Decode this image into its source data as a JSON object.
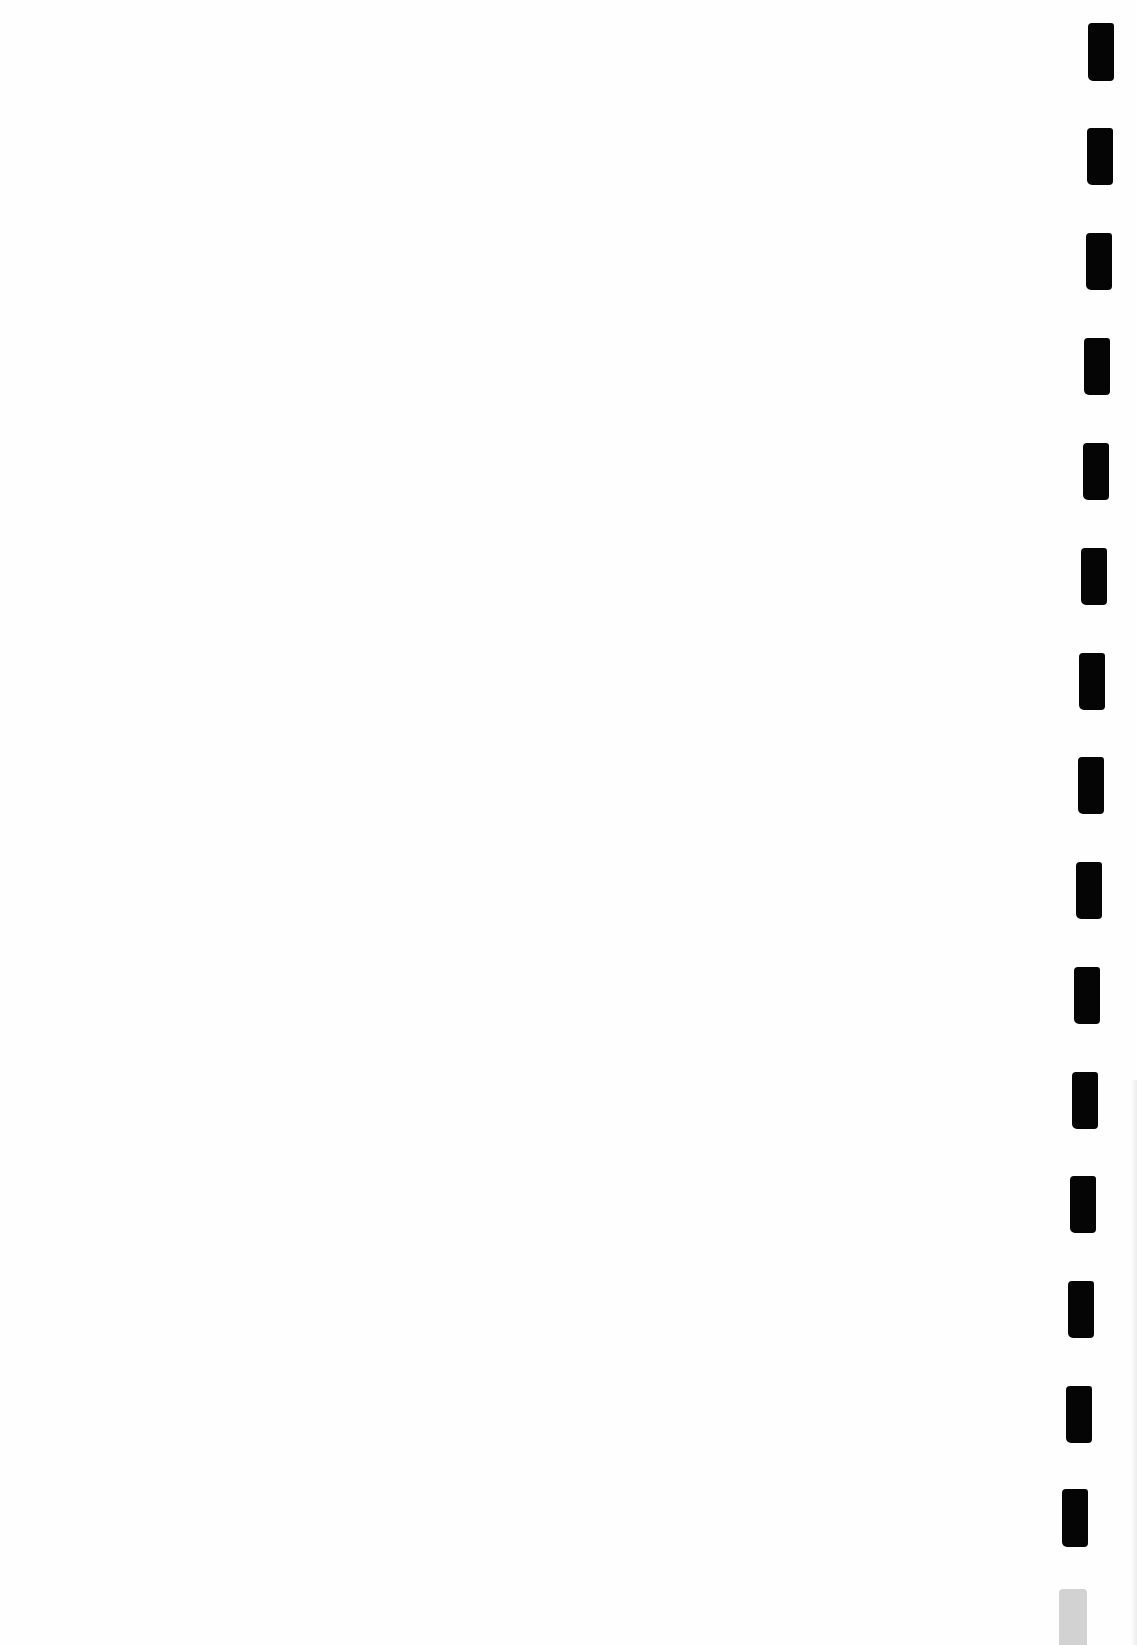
{
  "page": {
    "background": "#ffffff",
    "text_content": ""
  },
  "timing_marks": {
    "color": "#050505",
    "faded_color": "#d2d2d2",
    "marks": [
      {
        "x": 1088,
        "y": 23,
        "w": 26,
        "h": 58,
        "faded": false
      },
      {
        "x": 1087,
        "y": 128,
        "w": 26,
        "h": 57,
        "faded": false
      },
      {
        "x": 1086,
        "y": 233,
        "w": 26,
        "h": 57,
        "faded": false
      },
      {
        "x": 1084,
        "y": 338,
        "w": 26,
        "h": 57,
        "faded": false
      },
      {
        "x": 1083,
        "y": 443,
        "w": 26,
        "h": 57,
        "faded": false
      },
      {
        "x": 1081,
        "y": 548,
        "w": 26,
        "h": 57,
        "faded": false
      },
      {
        "x": 1079,
        "y": 653,
        "w": 26,
        "h": 57,
        "faded": false
      },
      {
        "x": 1078,
        "y": 757,
        "w": 26,
        "h": 57,
        "faded": false
      },
      {
        "x": 1076,
        "y": 862,
        "w": 26,
        "h": 57,
        "faded": false
      },
      {
        "x": 1074,
        "y": 967,
        "w": 26,
        "h": 57,
        "faded": false
      },
      {
        "x": 1072,
        "y": 1072,
        "w": 26,
        "h": 57,
        "faded": false
      },
      {
        "x": 1070,
        "y": 1176,
        "w": 26,
        "h": 57,
        "faded": false
      },
      {
        "x": 1068,
        "y": 1281,
        "w": 26,
        "h": 57,
        "faded": false
      },
      {
        "x": 1066,
        "y": 1386,
        "w": 26,
        "h": 57,
        "faded": false
      },
      {
        "x": 1062,
        "y": 1489,
        "w": 26,
        "h": 58,
        "faded": false
      },
      {
        "x": 1059,
        "y": 1589,
        "w": 28,
        "h": 56,
        "faded": true
      }
    ]
  }
}
